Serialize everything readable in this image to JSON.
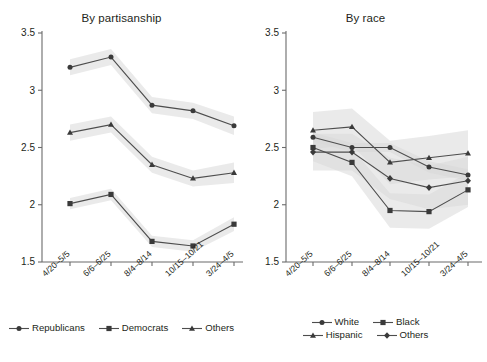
{
  "chart_data": [
    {
      "type": "line",
      "title": "By partisanship",
      "xlabel": "",
      "ylabel": "",
      "ylim": [
        1.5,
        3.5
      ],
      "yticks": [
        1.5,
        2,
        2.5,
        3,
        3.5
      ],
      "ytick_labels": [
        "1.5",
        "2",
        "2.5",
        "3",
        "3.5"
      ],
      "grid": false,
      "legend_position": "bottom",
      "bands": "shaded 95% confidence intervals",
      "categories": [
        "4/20–5/5",
        "6/6–6/25",
        "8/4–8/14",
        "10/15–10/21",
        "3/24–4/5"
      ],
      "series": [
        {
          "name": "Republicans",
          "marker": "circle",
          "values": [
            3.2,
            3.29,
            2.87,
            2.82,
            2.69
          ],
          "ci_low": [
            3.13,
            3.22,
            2.8,
            2.75,
            2.61
          ],
          "ci_high": [
            3.27,
            3.36,
            2.94,
            2.89,
            2.77
          ]
        },
        {
          "name": "Democrats",
          "marker": "square",
          "values": [
            2.01,
            2.09,
            1.68,
            1.64,
            1.83
          ],
          "ci_low": [
            1.96,
            2.04,
            1.63,
            1.59,
            1.77
          ],
          "ci_high": [
            2.06,
            2.14,
            1.73,
            1.69,
            1.89
          ]
        },
        {
          "name": "Others",
          "marker": "triangle",
          "values": [
            2.63,
            2.7,
            2.35,
            2.23,
            2.28
          ],
          "ci_low": [
            2.56,
            2.63,
            2.28,
            2.16,
            2.19
          ],
          "ci_high": [
            2.7,
            2.77,
            2.42,
            2.3,
            2.37
          ]
        }
      ]
    },
    {
      "type": "line",
      "title": "By race",
      "xlabel": "",
      "ylabel": "",
      "ylim": [
        1.5,
        3.5
      ],
      "yticks": [
        1.5,
        2,
        2.5,
        3,
        3.5
      ],
      "ytick_labels": [
        "1.5",
        "2",
        "2.5",
        "3",
        "3.5"
      ],
      "grid": false,
      "legend_position": "bottom",
      "bands": "shaded 95% confidence intervals",
      "categories": [
        "4/20–5/5",
        "6/6–6/25",
        "8/4–8/14",
        "10/15–10/21",
        "3/24–4/5"
      ],
      "series": [
        {
          "name": "White",
          "marker": "circle",
          "values": [
            2.59,
            2.5,
            2.5,
            2.33,
            2.26
          ],
          "ci_low": [
            2.55,
            2.46,
            2.46,
            2.28,
            2.21
          ],
          "ci_high": [
            2.63,
            2.54,
            2.54,
            2.38,
            2.31
          ]
        },
        {
          "name": "Black",
          "marker": "square",
          "values": [
            2.5,
            2.37,
            1.95,
            1.94,
            2.13
          ],
          "ci_low": [
            2.38,
            2.25,
            1.8,
            1.79,
            1.98
          ],
          "ci_high": [
            2.62,
            2.49,
            2.1,
            2.09,
            2.28
          ]
        },
        {
          "name": "Hispanic",
          "marker": "triangle",
          "values": [
            2.65,
            2.68,
            2.37,
            2.41,
            2.45
          ],
          "ci_low": [
            2.49,
            2.52,
            2.18,
            2.22,
            2.25
          ],
          "ci_high": [
            2.81,
            2.84,
            2.56,
            2.6,
            2.65
          ]
        },
        {
          "name": "Others",
          "marker": "diamond",
          "values": [
            2.46,
            2.46,
            2.23,
            2.15,
            2.21
          ],
          "ci_low": [
            2.3,
            2.3,
            2.05,
            1.96,
            2.0
          ],
          "ci_high": [
            2.62,
            2.62,
            2.41,
            2.34,
            2.42
          ]
        }
      ]
    }
  ],
  "panels": [
    {
      "title": "By partisanship",
      "ytick_labels": [
        "3.5",
        "3",
        "2.5",
        "2",
        "1.5"
      ],
      "xtick_labels": [
        "4/20–5/5",
        "6/6–6/25",
        "8/4–8/14",
        "10/15–10/21",
        "3/24–4/5"
      ],
      "legend": [
        {
          "label": "Republicans",
          "marker": "circle"
        },
        {
          "label": "Democrats",
          "marker": "square"
        },
        {
          "label": "Others",
          "marker": "triangle"
        }
      ]
    },
    {
      "title": "By race",
      "ytick_labels": [
        "3.5",
        "3",
        "2.5",
        "2",
        "1.5"
      ],
      "xtick_labels": [
        "4/20–5/5",
        "6/6–6/25",
        "8/4–8/14",
        "10/15–10/21",
        "3/24–4/5"
      ],
      "legend": [
        {
          "label": "White",
          "marker": "circle"
        },
        {
          "label": "Black",
          "marker": "square"
        },
        {
          "label": "Hispanic",
          "marker": "triangle"
        },
        {
          "label": "Others",
          "marker": "diamond"
        }
      ]
    }
  ],
  "colors": {
    "line": "#4d4d4d",
    "marker": "#3a3a3a",
    "axis": "#6b6b6b",
    "band": "#d9d9d9",
    "text": "#231f20",
    "background": "#ffffff"
  }
}
